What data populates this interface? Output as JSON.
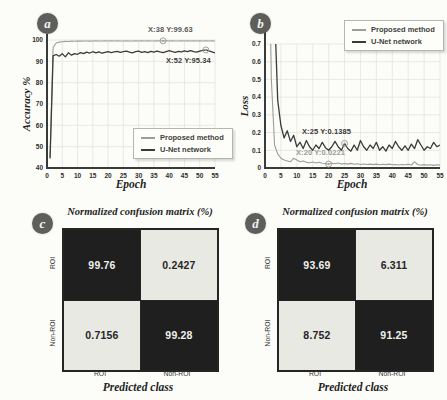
{
  "badges": [
    "a",
    "b",
    "c",
    "d"
  ],
  "colors": {
    "proposed": "#9c9c9c",
    "unet": "#3b3b3b",
    "grid": "#e3e3df",
    "axis": "#3a3a3a",
    "marker": "#a0a0a0",
    "dark_cell": "#1f1f1f",
    "light_cell": "#e9e9e4",
    "annotation_dark": "#3a3a3a",
    "annotation_gray": "#9a9a9a"
  },
  "chart_data": [
    {
      "type": "line",
      "panel": "a",
      "ylabel": "Accuracy %",
      "xlabel": "Epoch",
      "xlim": [
        0,
        55
      ],
      "ylim": [
        40,
        100
      ],
      "xticks": [
        0,
        5,
        10,
        15,
        20,
        25,
        30,
        35,
        40,
        45,
        50,
        55
      ],
      "yticks": [
        40,
        50,
        60,
        70,
        80,
        90,
        100
      ],
      "grid": true,
      "legend_position": "bottom-right",
      "x_start": 1,
      "x_step": 1,
      "series": [
        {
          "name": "Proposed method",
          "color_key": "proposed",
          "values": [
            45,
            96.5,
            98.6,
            99.0,
            99.2,
            99.35,
            99.3,
            99.45,
            99.4,
            99.5,
            99.45,
            99.55,
            99.5,
            99.45,
            99.55,
            99.6,
            99.5,
            99.55,
            99.6,
            99.55,
            99.6,
            99.5,
            99.6,
            99.55,
            99.5,
            99.6,
            99.55,
            99.5,
            99.6,
            99.55,
            99.6,
            99.5,
            99.6,
            99.55,
            99.5,
            99.6,
            99.55,
            99.63,
            99.6,
            99.5,
            99.6,
            99.55,
            99.5,
            99.6,
            99.55,
            99.6,
            99.5,
            99.6,
            99.55,
            99.6,
            99.5,
            99.6,
            99.55,
            99.6,
            99.55
          ]
        },
        {
          "name": "U-Net network",
          "color_key": "unet",
          "values": [
            44.5,
            92.6,
            93.2,
            92.4,
            93.6,
            92.1,
            94.0,
            92.9,
            93.6,
            93.3,
            94.1,
            93.6,
            94.3,
            93.9,
            94.5,
            94.0,
            94.4,
            93.8,
            94.2,
            94.6,
            94.1,
            94.4,
            94.7,
            94.2,
            94.5,
            94.8,
            94.3,
            94.0,
            94.5,
            94.8,
            94.2,
            94.6,
            94.1,
            94.7,
            94.3,
            94.8,
            94.4,
            94.1,
            94.6,
            95.0,
            94.5,
            94.2,
            94.7,
            94.4,
            94.9,
            94.5,
            95.0,
            94.6,
            94.3,
            94.8,
            95.1,
            95.34,
            94.9,
            94.4,
            93.9
          ]
        }
      ],
      "annotations": [
        {
          "text": "X:38 Y:99.63",
          "x": 38,
          "y": 99.63
        },
        {
          "text": "X:52 Y:95.34",
          "x": 52,
          "y": 95.34
        }
      ]
    },
    {
      "type": "line",
      "panel": "b",
      "ylabel": "Loss",
      "xlabel": "Epoch",
      "xlim": [
        0,
        55
      ],
      "ylim": [
        0,
        0.7
      ],
      "xticks": [
        0,
        5,
        10,
        15,
        20,
        25,
        30,
        35,
        40,
        45,
        50,
        55
      ],
      "yticks": [
        0,
        0.1,
        0.2,
        0.3,
        0.4,
        0.5,
        0.6,
        0.7
      ],
      "grid": true,
      "legend_position": "top-right",
      "x_start": 1,
      "x_step": 1,
      "series": [
        {
          "name": "Proposed method",
          "color_key": "proposed",
          "values": [
            1.5,
            0.5,
            0.13,
            0.08,
            0.055,
            0.045,
            0.04,
            0.035,
            0.055,
            0.045,
            0.035,
            0.04,
            0.032,
            0.03,
            0.034,
            0.028,
            0.032,
            0.027,
            0.025,
            0.0221,
            0.027,
            0.024,
            0.028,
            0.022,
            0.025,
            0.022,
            0.026,
            0.021,
            0.024,
            0.02,
            0.023,
            0.02,
            0.022,
            0.019,
            0.022,
            0.018,
            0.021,
            0.019,
            0.022,
            0.018,
            0.02,
            0.017,
            0.02,
            0.018,
            0.021,
            0.017,
            0.035,
            0.02,
            0.016,
            0.019,
            0.016,
            0.018,
            0.015,
            0.018,
            0.016
          ]
        },
        {
          "name": "U-Net network",
          "color_key": "unet",
          "values": [
            2.0,
            1.6,
            0.9,
            0.38,
            0.24,
            0.17,
            0.21,
            0.15,
            0.185,
            0.12,
            0.145,
            0.11,
            0.155,
            0.12,
            0.1,
            0.13,
            0.11,
            0.145,
            0.115,
            0.1,
            0.12,
            0.15,
            0.12,
            0.1,
            0.1385,
            0.11,
            0.095,
            0.13,
            0.1,
            0.155,
            0.12,
            0.1,
            0.13,
            0.11,
            0.145,
            0.1,
            0.12,
            0.095,
            0.13,
            0.11,
            0.15,
            0.12,
            0.1,
            0.125,
            0.1,
            0.135,
            0.11,
            0.16,
            0.13,
            0.1,
            0.12,
            0.11,
            0.145,
            0.12,
            0.13
          ]
        }
      ],
      "annotations": [
        {
          "text": "X:25 Y:0.1385",
          "x": 25,
          "y": 0.1385
        },
        {
          "text": "X:20 Y:0.0221",
          "x": 20,
          "y": 0.0221
        }
      ]
    },
    {
      "type": "heatmap",
      "panel": "c",
      "title": "Normalized confusion matrix (%)",
      "xlabel": "Predicted class",
      "rows": [
        "ROI",
        "Non-ROI"
      ],
      "cols": [
        "ROI",
        "Non-ROI"
      ],
      "values": [
        [
          "99.76",
          "0.2427"
        ],
        [
          "0.7156",
          "99.28"
        ]
      ]
    },
    {
      "type": "heatmap",
      "panel": "d",
      "title": "Normalized confusion matrix (%)",
      "xlabel": "Predicted class",
      "rows": [
        "ROI",
        "Non-ROI"
      ],
      "cols": [
        "ROI",
        "Non-ROI"
      ],
      "values": [
        [
          "93.69",
          "6.311"
        ],
        [
          "8.752",
          "91.25"
        ]
      ]
    }
  ]
}
